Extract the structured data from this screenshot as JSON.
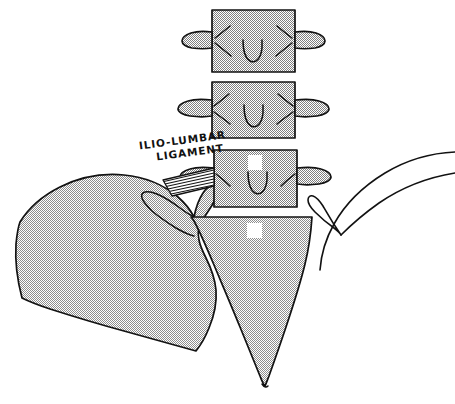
{
  "figure": {
    "title": "Ilio-Lumbar Ligament",
    "background_color": "#ffffff",
    "ink_color": "#121212",
    "stipple_color": "#9a9a9a"
  },
  "annotations": {
    "ligament_label_line1": "ILIO-LUMBAR",
    "ligament_label_line2": "LIGAMENT"
  },
  "bone_labels": {
    "l5": "5",
    "sacrum": "S"
  },
  "structures": {
    "vertebra_upper": "lumbar-vertebra-l3",
    "vertebra_middle": "lumbar-vertebra-l4",
    "vertebra_l5": "lumbar-vertebra-l5",
    "sacrum": "sacrum",
    "ilium_left": "ilium-left-shaded",
    "ilium_right": "ilium-right-outline",
    "ligament": "ilio-lumbar-ligament-fibers"
  }
}
